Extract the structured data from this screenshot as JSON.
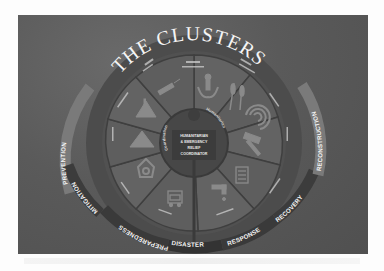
{
  "diagram": {
    "title": "THE CLUSTERS",
    "center": {
      "lines": [
        "HUMANITARIAN",
        "& EMERGENCY",
        "RELIEF",
        "COORDINATOR"
      ]
    },
    "inner_ring": {
      "left_label": "Coordination",
      "right_label": "Humanitarian"
    },
    "sectors": [
      {
        "name": "Protection",
        "icon": "protection-hands-icon"
      },
      {
        "name": "Food Security",
        "icon": "wheat-icon"
      },
      {
        "name": "Emergency Telecommunications",
        "icon": "telecom-signal-icon"
      },
      {
        "name": "Early Recovery",
        "icon": "hammer-icon"
      },
      {
        "name": "Education",
        "icon": "book-icon"
      },
      {
        "name": "Water Sanitation Hygiene",
        "icon": "water-tap-icon"
      },
      {
        "name": "Logistics",
        "icon": "truck-icon"
      },
      {
        "name": "Nutrition",
        "icon": "bowl-icon"
      },
      {
        "name": "Emergency Shelter",
        "icon": "tent-icon"
      },
      {
        "name": "Camp Coordination & Camp Management",
        "icon": "camp-tent-icon"
      },
      {
        "name": "Health",
        "icon": "syringe-icon"
      }
    ],
    "phases": [
      {
        "label": "PREVENTION"
      },
      {
        "label": "MITIGATION"
      },
      {
        "label": "PREPAREDNESS"
      },
      {
        "label": "DISASTER"
      },
      {
        "label": "RESPONSE"
      },
      {
        "label": "RECOVERY"
      },
      {
        "label": "RECONSTRUCTION"
      }
    ],
    "colors": {
      "background": "#5a5a5a",
      "wheel_outer": "#4a4a4a",
      "wedge": "#606060",
      "wedge_alt": "#585858",
      "hub": "#3e3e3e",
      "text": "#f2f2f2",
      "arrow": "#7a7a7a",
      "arrow_dark": "#3a3a3a"
    }
  }
}
